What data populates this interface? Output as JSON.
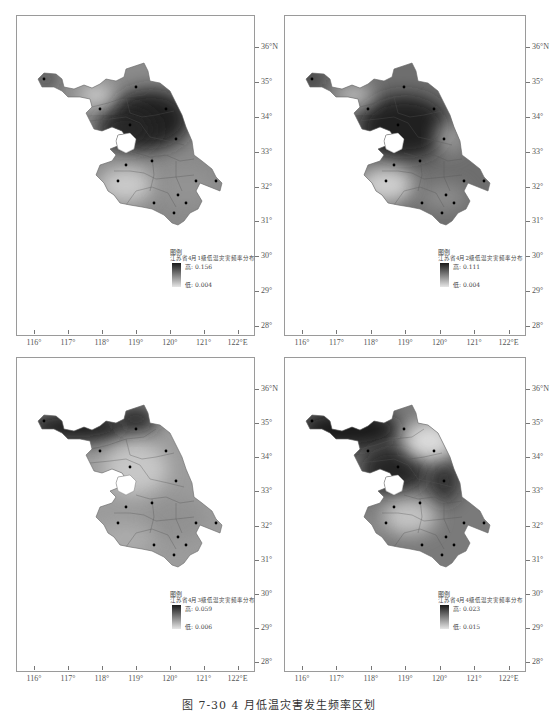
{
  "figure": {
    "caption": "图 7-30   4 月低温灾害发生频率区划",
    "lat_labels": [
      "36°N",
      "35°",
      "34°",
      "33°",
      "32°",
      "31°",
      "30°",
      "29°",
      "28°"
    ],
    "lon_labels": [
      "116°",
      "117°",
      "118°",
      "119°",
      "120°",
      "121°",
      "122°E"
    ]
  },
  "maps": [
    {
      "legend_title": "图例",
      "legend_subtitle": "江苏省4月1级低温灾害频率分布",
      "high_label": "高: 0.156",
      "low_label": "低: 0.004",
      "high_value": 0.156,
      "low_value": 0.004,
      "pattern": "dark band across center-north, light southwest and far northwest lobe"
    },
    {
      "legend_title": "图例",
      "legend_subtitle": "江苏省4月2级低温灾害频率分布",
      "high_label": "高: 0.111",
      "low_label": "低: 0.004",
      "high_value": 0.111,
      "low_value": 0.004,
      "pattern": "dark center, light southwest and northwest"
    },
    {
      "legend_title": "图例",
      "legend_subtitle": "江苏省4月3级低温灾害频率分布",
      "high_label": "高: 0.059",
      "low_label": "低: 0.006",
      "high_value": 0.059,
      "low_value": 0.006,
      "pattern": "dark far north/northwest, lighter south"
    },
    {
      "legend_title": "图例",
      "legend_subtitle": "江苏省4月4级低温灾害频率分布",
      "high_label": "高: 0.023",
      "low_label": "低: 0.015",
      "high_value": 0.023,
      "low_value": 0.015,
      "pattern": "dark northwest and center-east, light northeast coast and south-center"
    }
  ],
  "colors": {
    "frame": "#9a9a9a",
    "ramp_high": "#1a1a1a",
    "ramp_low": "#e6e6e6"
  }
}
